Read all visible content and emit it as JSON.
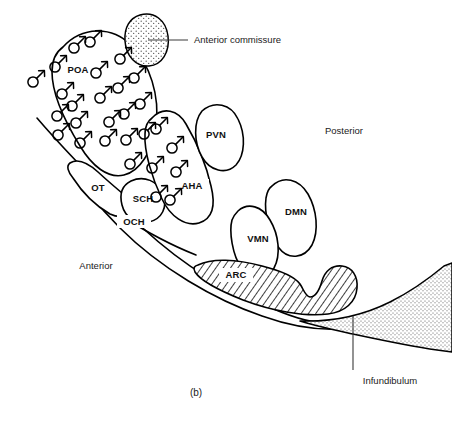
{
  "figure": {
    "panel_label": "(b)",
    "orientation": {
      "anterior": "Anterior",
      "posterior": "Posterior"
    }
  },
  "nuclei": [
    {
      "id": "POA",
      "label": "POA",
      "name": "preoptic-area",
      "lx": 78,
      "ly": 70,
      "has_mars": true
    },
    {
      "id": "AHA",
      "label": "AHA",
      "name": "anterior-hypothalamic-area",
      "lx": 192,
      "ly": 186,
      "has_mars": true
    },
    {
      "id": "PVN",
      "label": "PVN",
      "name": "paraventricular-nucleus",
      "lx": 216,
      "ly": 135,
      "has_mars": false
    },
    {
      "id": "SCH",
      "label": "SCH",
      "name": "suprachiasmatic-nucleus",
      "lx": 143,
      "ly": 199,
      "has_mars": false
    },
    {
      "id": "OT",
      "label": "OT",
      "name": "optic-tract",
      "lx": 98,
      "ly": 188,
      "has_mars": false
    },
    {
      "id": "OCH",
      "label": "OCH",
      "name": "optic-chiasm",
      "lx": 134,
      "ly": 222,
      "has_mars": false
    },
    {
      "id": "VMN",
      "label": "VMN",
      "name": "ventromedial-nucleus",
      "lx": 258,
      "ly": 239,
      "has_mars": false
    },
    {
      "id": "DMN",
      "label": "DMN",
      "name": "dorsomedial-nucleus",
      "lx": 296,
      "ly": 212,
      "has_mars": false
    },
    {
      "id": "ARC",
      "label": "ARC",
      "name": "arcuate-nucleus",
      "lx": 236,
      "ly": 275,
      "has_mars": false
    }
  ],
  "annotations": [
    {
      "id": "anterior_commissure",
      "label": "Anterior commissure",
      "name": "anterior-commissure",
      "text_x": 194,
      "text_y": 40,
      "anchor": "start",
      "leader": {
        "x1": 188,
        "y1": 40,
        "x2": 148,
        "y2": 40
      },
      "fill": "stipple"
    },
    {
      "id": "infundibulum",
      "label": "Infundibulum",
      "name": "infundibulum",
      "text_x": 390,
      "text_y": 381,
      "anchor": "middle",
      "leader": {
        "x1": 353,
        "y1": 316,
        "x2": 353,
        "y2": 370
      },
      "fill": "stipple"
    }
  ],
  "orientation_labels": [
    {
      "id": "posterior",
      "label": "Posterior",
      "name": "posterior-label",
      "x": 344,
      "y": 131
    },
    {
      "id": "anterior",
      "label": "Anterior",
      "name": "anterior-label",
      "x": 96,
      "y": 266
    }
  ],
  "colors": {
    "ink": "#000000",
    "paper": "#ffffff",
    "leader": "#3a3a3a",
    "hatch": "#000000",
    "stipple": "#555555"
  },
  "mars_symbols": {
    "name": "mars-symbol",
    "description": "male-sex-symbol",
    "poa_positions": [
      [
        33,
        82
      ],
      [
        55,
        67
      ],
      [
        62,
        94
      ],
      [
        57,
        116
      ],
      [
        58,
        135
      ],
      [
        74,
        48
      ],
      [
        72,
        106
      ],
      [
        76,
        123
      ],
      [
        80,
        143
      ],
      [
        90,
        42
      ],
      [
        96,
        73
      ],
      [
        100,
        98
      ],
      [
        109,
        122
      ],
      [
        105,
        141
      ],
      [
        120,
        59
      ],
      [
        118,
        88
      ],
      [
        124,
        114
      ],
      [
        126,
        140
      ],
      [
        134,
        78
      ],
      [
        140,
        104
      ],
      [
        144,
        134
      ],
      [
        130,
        164
      ],
      [
        152,
        168
      ]
    ],
    "aha_positions": [
      [
        156,
        129
      ],
      [
        172,
        148
      ],
      [
        176,
        172
      ],
      [
        170,
        200
      ],
      [
        156,
        197
      ]
    ]
  }
}
